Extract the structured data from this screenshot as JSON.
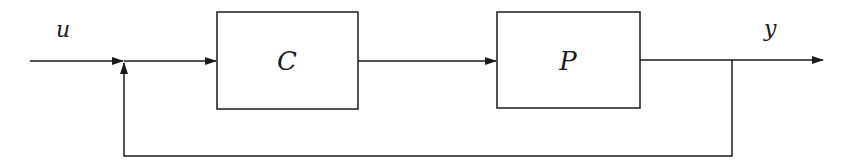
{
  "diagram": {
    "type": "feedback-control-loop",
    "signals": {
      "input": "u",
      "output": "y"
    },
    "blocks": [
      {
        "id": "controller",
        "label": "C"
      },
      {
        "id": "plant",
        "label": "P"
      }
    ],
    "connections": [
      {
        "from": "u",
        "to": "summing-junction"
      },
      {
        "from": "summing-junction",
        "to": "C"
      },
      {
        "from": "C",
        "to": "P"
      },
      {
        "from": "P",
        "to": "y"
      },
      {
        "from": "y",
        "to": "summing-junction",
        "kind": "feedback"
      }
    ],
    "colors": {
      "stroke": "#1a1a1a",
      "background": "#ffffff"
    }
  }
}
